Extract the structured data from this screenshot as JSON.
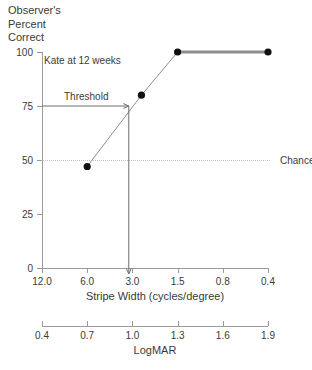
{
  "chart_data": {
    "type": "line",
    "title": "",
    "ylabel": "Observer's\nPercent\nCorrect",
    "xlabel": "Stripe Width (cycles/degree)",
    "secondary_xlabel": "LogMAR",
    "ylim": [
      0,
      100
    ],
    "yticks": [
      0,
      25,
      50,
      75,
      100
    ],
    "ytick_labels": [
      "0",
      "25",
      "50",
      "75",
      "100"
    ],
    "xtick_labels": [
      "12.0",
      "6.0",
      "3.0",
      "1.5",
      "0.8",
      "0.4"
    ],
    "xtick_values": [
      12.0,
      6.0,
      3.0,
      1.5,
      0.8,
      0.4
    ],
    "secondary_xtick_labels": [
      "0.4",
      "0.7",
      "1.0",
      "1.3",
      "1.6",
      "1.9"
    ],
    "secondary_xtick_values": [
      0.4,
      0.7,
      1.0,
      1.3,
      1.6,
      1.9
    ],
    "grid": false,
    "legend": "none",
    "series": [
      {
        "name": "Kate at 12 weeks",
        "points": [
          {
            "x_index": 1.0,
            "stripe_width": 6.0,
            "percent_correct": 47
          },
          {
            "x_index": 2.2,
            "stripe_width": 2.5,
            "percent_correct": 80
          },
          {
            "x_index": 3.0,
            "stripe_width": 1.5,
            "percent_correct": 100
          },
          {
            "x_index": 5.0,
            "stripe_width": 0.4,
            "percent_correct": 100
          }
        ]
      }
    ],
    "annotations": [
      {
        "name": "observer-annotation",
        "text": "Kate at 12 weeks"
      },
      {
        "name": "threshold-annotation",
        "text": "Threshold",
        "percent_correct": 75
      },
      {
        "name": "chance-annotation",
        "text": "Chance",
        "percent_correct": 50
      }
    ],
    "threshold": {
      "percent_correct": 75,
      "x_index": 1.92,
      "label": "Threshold"
    },
    "chance": {
      "percent_correct": 50,
      "label": "Chance"
    }
  },
  "axes": {
    "y_caption": "Observer's\nPercent\nCorrect",
    "x_title": "Stripe Width (cycles/degree)",
    "logmar_title": "LogMAR"
  }
}
